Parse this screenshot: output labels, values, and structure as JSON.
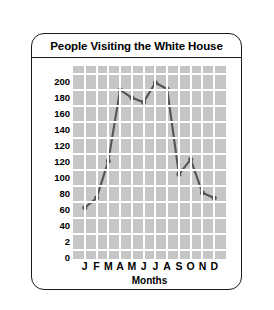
{
  "card": {
    "title": "People Visiting the White House"
  },
  "chart_data": {
    "type": "line",
    "title": "People Visiting the White House",
    "xlabel": "Months",
    "ylabel": "Number of Visitors (in thousands)",
    "categories": [
      "J",
      "F",
      "M",
      "A",
      "M",
      "J",
      "J",
      "A",
      "S",
      "O",
      "N",
      "D"
    ],
    "category_names": [
      "January",
      "February",
      "March",
      "April",
      "May",
      "June",
      "July",
      "August",
      "September",
      "October",
      "November",
      "December"
    ],
    "values": [
      48,
      59,
      101,
      182,
      173,
      168,
      190,
      183,
      86,
      103,
      65,
      59
    ],
    "series": [
      {
        "name": "Visitors",
        "values": [
          48,
          59,
          101,
          182,
          173,
          168,
          190,
          183,
          86,
          103,
          65,
          59
        ]
      }
    ],
    "ylim": [
      0,
      220
    ],
    "y_tick_labels": [
      "200",
      "180",
      "160",
      "140",
      "120",
      "120",
      "100",
      "80",
      "60",
      "40",
      "2",
      "0"
    ],
    "y_tick_values": [
      200,
      180,
      160,
      140,
      120,
      110,
      100,
      80,
      60,
      40,
      20,
      0
    ],
    "grid": true,
    "legend": "none",
    "line_color": "#555555",
    "marker_color": "#555555",
    "plot_background": "#c6c6c6",
    "gridline_color": "#ffffff"
  }
}
